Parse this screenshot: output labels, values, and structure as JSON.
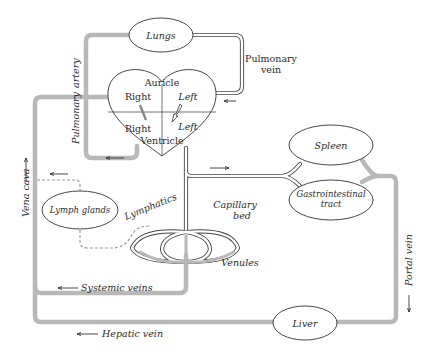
{
  "figure": {
    "type": "circulatory-system-diagram",
    "colors": {
      "artery_vein_thick": "#b8b8b8",
      "outline": "#333333",
      "lymphatic_dashed": "#9a9a9a",
      "background": "#ffffff"
    }
  },
  "organs": {
    "lungs": "Lungs",
    "spleen": "Spleen",
    "gi_tract_line1": "Gastrointestinal",
    "gi_tract_line2": "tract",
    "liver": "Liver",
    "lymph_glands": "Lymph glands"
  },
  "heart": {
    "auricle": "Auricle",
    "ventricle": "Ventricle",
    "right_auricle": "Right",
    "left_auricle": "Left",
    "right_ventricle": "Right",
    "left_ventricle": "Left"
  },
  "vessels": {
    "pulmonary_artery_word1": "Pulmonary",
    "pulmonary_artery_word2": "artery",
    "pulmonary_vein_line1": "Pulmonary",
    "pulmonary_vein_line2": "vein",
    "vena_cava": "Vena cava",
    "portal_vein": "Portal vein",
    "hepatic_vein": "Hepatic vein",
    "systemic_veins": "Systemic veins",
    "lymphatics": "Lymphatics",
    "capillary_line1": "Capillary",
    "capillary_line2": "bed",
    "venules": "Venules"
  }
}
